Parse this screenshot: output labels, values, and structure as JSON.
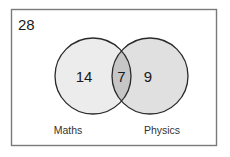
{
  "diagram": {
    "type": "venn",
    "universal_total": "28",
    "sets": [
      {
        "name": "Maths",
        "only_count": "14",
        "fill": "#ececec"
      },
      {
        "name": "Physics",
        "only_count": "9",
        "fill": "#e0e0e0"
      }
    ],
    "intersection": {
      "count": "7",
      "fill": "#c6c6c6"
    },
    "colors": {
      "frame": "#7a7a7a",
      "circle_stroke": "#2a2a2a",
      "background": "#ffffff"
    }
  }
}
